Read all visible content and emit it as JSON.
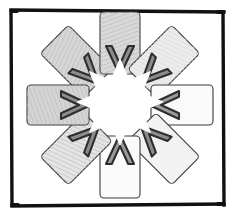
{
  "figure": {
    "title": "Radial arrangement of eight hatched rectangles with inward-pointing chevrons",
    "shape_count": "8",
    "angular_step_degrees": "45",
    "center_x": "120",
    "center_y": "105"
  },
  "colors": {
    "frame_stroke": "#111111",
    "background": "#ffffff",
    "tile_stroke": "#3a3a3a",
    "chevron_stroke": "#2e2e2e",
    "chevron_fill": "#808080",
    "hatch_line": "#bdbdbd",
    "fill_dark": "#d2d2d2",
    "fill_mid": "#e0e0e0",
    "fill_light": "#ededed",
    "fill_pale": "#f7f7f7",
    "star_fill": "#ffffff"
  },
  "frame": {
    "name": "outer-frame",
    "x": "10",
    "y": "9",
    "width": "215",
    "height": "197",
    "stroke_width": "4"
  },
  "tiles": [
    {
      "id": "tile-n",
      "label": "north-tile",
      "angle_degrees": "0",
      "position": "top",
      "fill": "#d9d9d9",
      "hatched": "true",
      "chevron_direction": "down"
    },
    {
      "id": "tile-ne",
      "label": "northeast-tile",
      "angle_degrees": "45",
      "position": "top-right",
      "fill": "#ececec",
      "hatched": "true",
      "chevron_direction": "down-left"
    },
    {
      "id": "tile-e",
      "label": "east-tile",
      "angle_degrees": "90",
      "position": "right",
      "fill": "#fafafa",
      "hatched": "false",
      "chevron_direction": "left"
    },
    {
      "id": "tile-se",
      "label": "southeast-tile",
      "angle_degrees": "135",
      "position": "bottom-right",
      "fill": "#f2f2f2",
      "hatched": "false",
      "chevron_direction": "up-left"
    },
    {
      "id": "tile-s",
      "label": "south-tile",
      "angle_degrees": "180",
      "position": "bottom",
      "fill": "#fbfbfb",
      "hatched": "false",
      "chevron_direction": "up"
    },
    {
      "id": "tile-sw",
      "label": "southwest-tile",
      "angle_degrees": "225",
      "position": "bottom-left",
      "fill": "#e4e4e4",
      "hatched": "true",
      "chevron_direction": "up-right"
    },
    {
      "id": "tile-w",
      "label": "west-tile",
      "angle_degrees": "270",
      "position": "left",
      "fill": "#d4d4d4",
      "hatched": "true",
      "chevron_direction": "right"
    },
    {
      "id": "tile-nw",
      "label": "northwest-tile",
      "angle_degrees": "315",
      "position": "top-left",
      "fill": "#d6d6d6",
      "hatched": "true",
      "chevron_direction": "down-right"
    }
  ],
  "geometry": {
    "tile_width": "40",
    "tile_height": "62",
    "tile_corner_radius": "4",
    "tile_center_offset": "62",
    "chevron_outer_half_width": "14",
    "chevron_depth": "26",
    "chevron_thickness": "7",
    "star_outer_radius": "46",
    "star_inner_radius": "33"
  }
}
